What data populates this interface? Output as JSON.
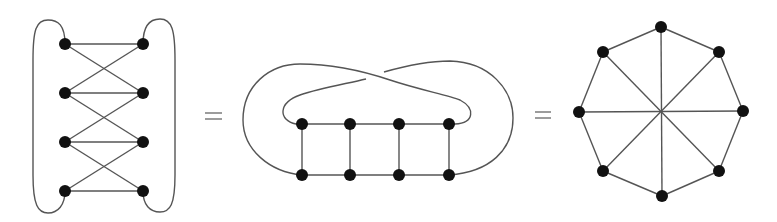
{
  "diagram": {
    "colors": {
      "edge": "#555555",
      "node": "#111111",
      "background": "#ffffff"
    },
    "separators": [
      "=",
      "="
    ],
    "graphs": [
      {
        "name": "crossed-ladder",
        "nodes": [
          {
            "id": "L1",
            "x": 65,
            "y": 44
          },
          {
            "id": "L2",
            "x": 65,
            "y": 93
          },
          {
            "id": "L3",
            "x": 65,
            "y": 142
          },
          {
            "id": "L4",
            "x": 65,
            "y": 191
          },
          {
            "id": "R1",
            "x": 143,
            "y": 44
          },
          {
            "id": "R2",
            "x": 143,
            "y": 93
          },
          {
            "id": "R3",
            "x": 143,
            "y": 142
          },
          {
            "id": "R4",
            "x": 143,
            "y": 191
          }
        ],
        "edges": [
          [
            "L1",
            "R1"
          ],
          [
            "L2",
            "R2"
          ],
          [
            "L3",
            "R3"
          ],
          [
            "L4",
            "R4"
          ],
          [
            "L1",
            "R2"
          ],
          [
            "R1",
            "L2"
          ],
          [
            "L2",
            "R3"
          ],
          [
            "R2",
            "L3"
          ],
          [
            "L3",
            "R4"
          ],
          [
            "R3",
            "L4"
          ],
          [
            "L1",
            "L4"
          ],
          [
            "R1",
            "R4"
          ]
        ]
      },
      {
        "name": "twisted-ladder",
        "nodes": [
          {
            "id": "T1",
            "x": 302,
            "y": 124
          },
          {
            "id": "T2",
            "x": 350,
            "y": 124
          },
          {
            "id": "T3",
            "x": 399,
            "y": 124
          },
          {
            "id": "T4",
            "x": 449,
            "y": 124
          },
          {
            "id": "B1",
            "x": 302,
            "y": 175
          },
          {
            "id": "B2",
            "x": 350,
            "y": 175
          },
          {
            "id": "B3",
            "x": 399,
            "y": 175
          },
          {
            "id": "B4",
            "x": 449,
            "y": 175
          }
        ],
        "edges": [
          [
            "T1",
            "T2"
          ],
          [
            "T2",
            "T3"
          ],
          [
            "T3",
            "T4"
          ],
          [
            "B1",
            "B2"
          ],
          [
            "B2",
            "B3"
          ],
          [
            "B3",
            "B4"
          ],
          [
            "T1",
            "B1"
          ],
          [
            "T2",
            "B2"
          ],
          [
            "T3",
            "B3"
          ],
          [
            "T4",
            "B4"
          ],
          [
            "T1",
            "B4"
          ],
          [
            "B1",
            "T4"
          ]
        ]
      },
      {
        "name": "octagon-with-diameters",
        "center": {
          "x": 661,
          "y": 112
        },
        "nodes": [
          {
            "id": "O1",
            "x": 661,
            "y": 27
          },
          {
            "id": "O2",
            "x": 719,
            "y": 52
          },
          {
            "id": "O3",
            "x": 743,
            "y": 111
          },
          {
            "id": "O4",
            "x": 719,
            "y": 171
          },
          {
            "id": "O5",
            "x": 662,
            "y": 196
          },
          {
            "id": "O6",
            "x": 603,
            "y": 171
          },
          {
            "id": "O7",
            "x": 579,
            "y": 112
          },
          {
            "id": "O8",
            "x": 603,
            "y": 52
          }
        ],
        "edges": [
          [
            "O1",
            "O2"
          ],
          [
            "O2",
            "O3"
          ],
          [
            "O3",
            "O4"
          ],
          [
            "O4",
            "O5"
          ],
          [
            "O5",
            "O6"
          ],
          [
            "O6",
            "O7"
          ],
          [
            "O7",
            "O8"
          ],
          [
            "O8",
            "O1"
          ],
          [
            "O1",
            "O5"
          ],
          [
            "O2",
            "O6"
          ],
          [
            "O3",
            "O7"
          ],
          [
            "O4",
            "O8"
          ]
        ]
      }
    ]
  }
}
